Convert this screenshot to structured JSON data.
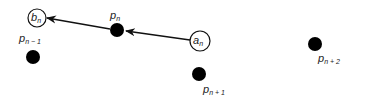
{
  "diagram": {
    "colors": {
      "stroke": "#111111",
      "dot": "#000000",
      "background": "#ffffff"
    },
    "points": [
      {
        "id": "p_n_minus_1",
        "base": "p",
        "sub": "n − 1"
      },
      {
        "id": "p_n",
        "base": "p",
        "sub": "n"
      },
      {
        "id": "p_n_plus_1",
        "base": "p",
        "sub": "n + 1"
      },
      {
        "id": "p_n_plus_2",
        "base": "p",
        "sub": "n + 2"
      }
    ],
    "nodes": [
      {
        "id": "b_n",
        "base": "b",
        "sub": "n"
      },
      {
        "id": "a_n",
        "base": "a",
        "sub": "n"
      }
    ],
    "arrows": [
      {
        "from": "a_n",
        "to": "p_n"
      },
      {
        "from": "p_n",
        "to": "b_n"
      }
    ]
  }
}
